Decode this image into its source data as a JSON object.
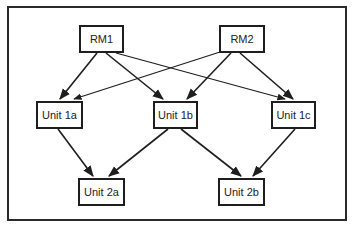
{
  "diagram": {
    "type": "directed-graph",
    "nodes": [
      {
        "id": "rm1",
        "label": "RM1",
        "x": 79,
        "y": 25,
        "w": 45,
        "h": 28
      },
      {
        "id": "rm2",
        "label": "RM2",
        "x": 219,
        "y": 25,
        "w": 46,
        "h": 28
      },
      {
        "id": "u1a",
        "label": "Unit 1a",
        "x": 36,
        "y": 101,
        "w": 47,
        "h": 28
      },
      {
        "id": "u1b",
        "label": "Unit 1b",
        "x": 153,
        "y": 101,
        "w": 45,
        "h": 28
      },
      {
        "id": "u1c",
        "label": "Unit 1c",
        "x": 271,
        "y": 101,
        "w": 45,
        "h": 28
      },
      {
        "id": "u2a",
        "label": "Unit 2a",
        "x": 78,
        "y": 178,
        "w": 47,
        "h": 28
      },
      {
        "id": "u2b",
        "label": "Unit 2b",
        "x": 218,
        "y": 178,
        "w": 47,
        "h": 28
      }
    ],
    "edges": [
      {
        "from": "rm1",
        "to": "u1a"
      },
      {
        "from": "rm1",
        "to": "u1b"
      },
      {
        "from": "rm1",
        "to": "u1c"
      },
      {
        "from": "rm2",
        "to": "u1a"
      },
      {
        "from": "rm2",
        "to": "u1b"
      },
      {
        "from": "rm2",
        "to": "u1c"
      },
      {
        "from": "u1a",
        "to": "u2a"
      },
      {
        "from": "u1b",
        "to": "u2a"
      },
      {
        "from": "u1b",
        "to": "u2b"
      },
      {
        "from": "u1c",
        "to": "u2b"
      }
    ],
    "colors": {
      "line": "#1e1e1e",
      "background": "#ffffff"
    }
  }
}
